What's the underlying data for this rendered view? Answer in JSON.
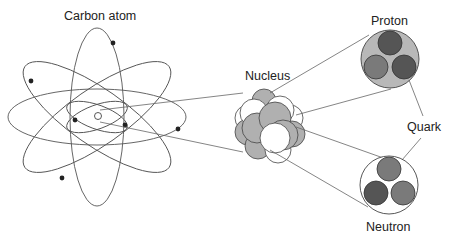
{
  "labels": {
    "atom": "Carbon atom",
    "nucleus": "Nucleus",
    "proton": "Proton",
    "quark": "Quark",
    "neutron": "Neutron"
  },
  "colors": {
    "line": "#555555",
    "electron": "#222222",
    "proton_fill": "#b8b8b8",
    "nucleon_gray": "#b0b0b0",
    "quark_dark": "#555555",
    "quark_mid": "#7a7a7a"
  }
}
